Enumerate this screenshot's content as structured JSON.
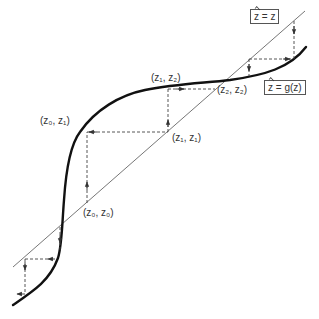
{
  "diagram": {
    "type": "cobweb plot",
    "identity_line_label": {
      "var": "z",
      "rhs": "= z"
    },
    "map_curve_label": {
      "var": "z",
      "rhs": "= g(z)"
    },
    "point_labels": [
      {
        "id": "z0_z0",
        "text": "(z₀, z₀)"
      },
      {
        "id": "z0_z1",
        "text": "(z₀, z₁)"
      },
      {
        "id": "z1_z1",
        "text": "(z₁, z₁)"
      },
      {
        "id": "z1_z2",
        "text": "(z₁, z₂)"
      },
      {
        "id": "z2_z2",
        "text": "(z₂, z₂)"
      }
    ],
    "colors": {
      "curve": "#111111",
      "identity_line": "#555555",
      "dashed": "#444444"
    }
  }
}
